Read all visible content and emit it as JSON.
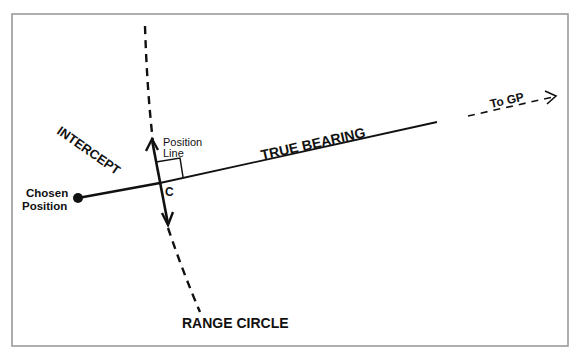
{
  "diagram": {
    "colors": {
      "ink": "#111111",
      "frame": "#9a9a9a",
      "background": "#ffffff"
    },
    "labels": {
      "intercept": "INTERCEPT",
      "true_bearing": "TRUE BEARING",
      "to_gp": "To GP",
      "position_line_1": "Position",
      "position_line_2": "Line",
      "point_c": "C",
      "chosen_position_1": "Chosen",
      "chosen_position_2": "Position",
      "range_circle": "RANGE CIRCLE"
    },
    "elements": [
      {
        "id": "chosen-position",
        "type": "point"
      },
      {
        "id": "true-bearing",
        "type": "solid line"
      },
      {
        "id": "to-gp",
        "type": "dashed arrow"
      },
      {
        "id": "position-line",
        "type": "double-headed arrow"
      },
      {
        "id": "range-circle",
        "type": "dashed arc"
      },
      {
        "id": "right-angle",
        "type": "square marker"
      }
    ]
  }
}
